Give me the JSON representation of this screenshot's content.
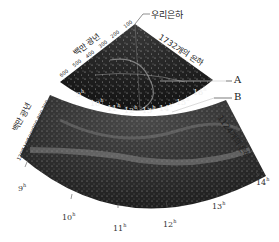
{
  "figure": {
    "milky_way_label": "우리은하",
    "callout_a": "A",
    "callout_b": "B"
  },
  "upper_wedge": {
    "galaxy_count_label": "1732개의 은하",
    "distance_unit_label": "백만 광년",
    "distance_ticks": [
      "100",
      "200",
      "300",
      "400",
      "500",
      "600"
    ],
    "ra_ticks": [
      "9",
      "10",
      "11",
      "12",
      "13",
      "14",
      "15",
      "16"
    ],
    "ra_unit": "h"
  },
  "lower_wedge": {
    "galaxy_count_label": "1124개의 은하",
    "distance_unit_label": "백만 광년",
    "distance_ticks": [
      "700",
      "800",
      "900",
      "1000",
      "1100",
      "1200"
    ],
    "ra_ticks": [
      "9",
      "10",
      "11",
      "12",
      "13",
      "14"
    ],
    "ra_unit": "h"
  },
  "colors": {
    "upper_fill": "#1a1a1a",
    "lower_fill": "#2e2e2e",
    "galaxy_dots": "#d8d8d8",
    "background": "#ffffff"
  }
}
